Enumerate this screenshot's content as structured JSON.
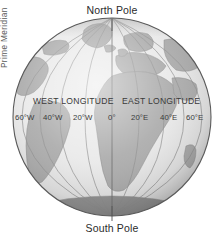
{
  "figure": {
    "type": "globe-diagram",
    "background_color": "#ffffff"
  },
  "globe": {
    "ocean_color": "#e9e9e9",
    "land_color": "#a9a9a9",
    "outline_color": "#555555",
    "graticule_color": "#8c8c8c",
    "center_x": 112,
    "center_y": 117,
    "radius": 99
  },
  "poles": {
    "north_label": "North Pole",
    "south_label": "South Pole"
  },
  "hemispheres": {
    "west_label": "WEST LONGITUDE",
    "east_label": "EAST LONGITUDE"
  },
  "prime_meridian": {
    "label": "Prime Meridian"
  },
  "longitude_ticks": [
    {
      "label": "60°W",
      "x": 15,
      "value": -60
    },
    {
      "label": "40°W",
      "x": 43,
      "value": -40
    },
    {
      "label": "20°W",
      "x": 73,
      "value": -20
    },
    {
      "label": "0°",
      "x": 108,
      "value": 0
    },
    {
      "label": "20°E",
      "x": 131,
      "value": 20
    },
    {
      "label": "40°E",
      "x": 160,
      "value": 40
    },
    {
      "label": "60°E",
      "x": 186,
      "value": 60
    }
  ]
}
